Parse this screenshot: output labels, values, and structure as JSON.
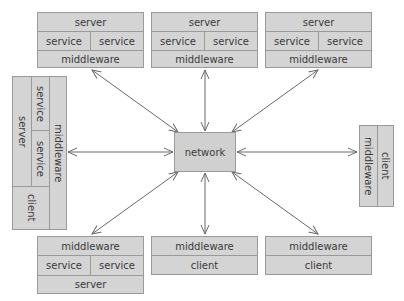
{
  "diagram": {
    "center": {
      "label": "network"
    },
    "nodes": {
      "top_left": {
        "row1": "server",
        "row2_left": "service",
        "row2_right": "service",
        "row3": "middleware"
      },
      "top_center": {
        "row1": "server",
        "row2_left": "service",
        "row2_right": "service",
        "row3": "middleware"
      },
      "top_right": {
        "row1": "server",
        "row2_left": "service",
        "row2_right": "service",
        "row3": "middleware"
      },
      "left": {
        "server": "server",
        "service_top": "service",
        "service_bottom": "service",
        "middleware": "middleware",
        "client": "client"
      },
      "right": {
        "middleware": "middleware",
        "client": "client"
      },
      "bottom_left": {
        "row1": "middleware",
        "row2_left": "service",
        "row2_right": "service",
        "row3": "server"
      },
      "bottom_center": {
        "row1": "middleware",
        "row2": "client"
      },
      "bottom_right": {
        "row1": "middleware",
        "row2": "client"
      }
    },
    "colors": {
      "box_fill": "#d4d4d4",
      "border": "#9a9a9a",
      "arrow": "#6a6a6a"
    }
  }
}
